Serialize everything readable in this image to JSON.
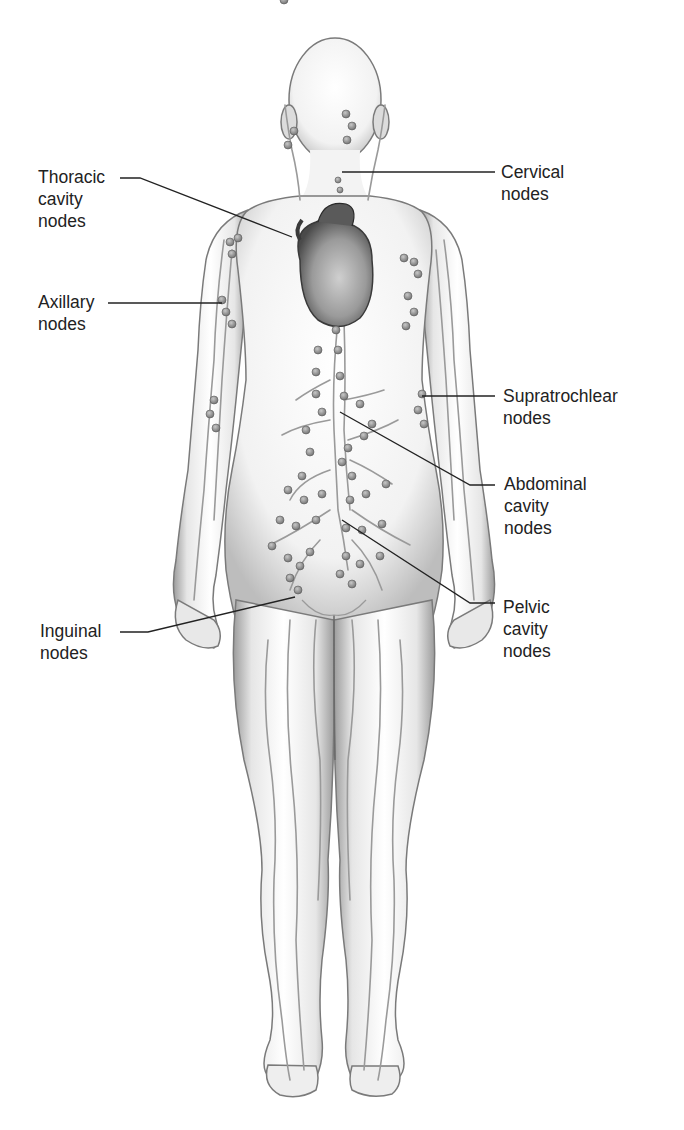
{
  "figure": {
    "colors": {
      "background": "#ffffff",
      "skin": "#f4f4f4",
      "shade": "#8a8a8a",
      "vessel": "#9a9a9a",
      "node": "#8c8c8c",
      "leader_line": "#222222",
      "text": "#222222"
    }
  },
  "labels": {
    "thoracic": {
      "lines": [
        "Thoracic",
        "cavity",
        "nodes"
      ]
    },
    "axillary": {
      "lines": [
        "Axillary",
        "nodes"
      ]
    },
    "inguinal": {
      "lines": [
        "Inguinal",
        "nodes"
      ]
    },
    "cervical": {
      "lines": [
        "Cervical",
        "nodes"
      ]
    },
    "supratrochlear": {
      "lines": [
        "Supratrochlear",
        "nodes"
      ]
    },
    "abdominal": {
      "lines": [
        "Abdominal",
        "cavity",
        "nodes"
      ]
    },
    "pelvic": {
      "lines": [
        "Pelvic",
        "cavity",
        "nodes"
      ]
    }
  }
}
